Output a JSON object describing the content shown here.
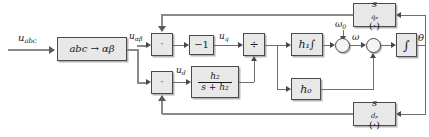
{
  "diagram": {
    "background": "#ffffff",
    "block_fill": "#e8e8e8",
    "line_color": "#6e6e6e",
    "blocks": {
      "clarke": "abc → αβ",
      "mul_q": "·",
      "mul_d": "·",
      "gain_neg1": "−1",
      "divide": "÷",
      "lpf_num": "h₂",
      "lpf_den": "s + h₂",
      "h1_int": "h₁∫",
      "h0": "h₀",
      "integrator": "∫",
      "s_qp": "s",
      "s_qp_sub": "qₚ",
      "s_qp_arg": "(·)",
      "s_dp": "s",
      "s_dp_sub": "dₚ",
      "s_dp_arg": "(·)"
    },
    "signals": {
      "u_abc": "u",
      "u_abc_sub": "abc",
      "u_alphabeta": "u",
      "u_alphabeta_sub": "αβ",
      "u_q": "u",
      "u_q_sub": "q",
      "u_d": "u",
      "u_d_sub": "d",
      "omega_0": "ω",
      "omega_0_sub": "0",
      "omega": "ω",
      "theta": "θ"
    }
  }
}
